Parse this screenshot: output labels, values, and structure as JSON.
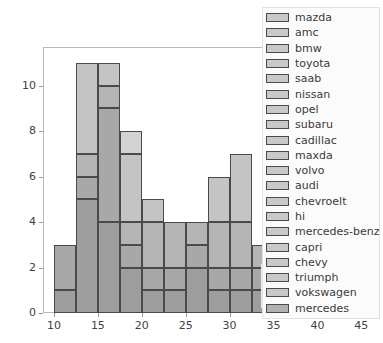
{
  "chart_data": {
    "type": "bar",
    "title": "",
    "subtitle": "",
    "xlabel": "",
    "ylabel": "Count",
    "orientation": "vertical",
    "stacked": true,
    "grid": false,
    "legend_position": "upper-right-outside",
    "xlim": [
      8.75,
      46.9
    ],
    "ylim": [
      0,
      11.7
    ],
    "xticks": [
      10,
      15,
      20,
      25,
      30,
      35,
      40,
      45
    ],
    "yticks": [
      0,
      2,
      4,
      6,
      8,
      10
    ],
    "xtick_labels": [
      "10",
      "15",
      "20",
      "25",
      "30",
      "35",
      "40",
      "45"
    ],
    "ytick_labels": [
      "0",
      "2",
      "4",
      "6",
      "8",
      "10"
    ],
    "bin_width": 2.5,
    "bars": [
      {
        "x0": 10.0,
        "x1": 12.5,
        "total": 3,
        "segments": [
          1,
          2
        ]
      },
      {
        "x0": 12.5,
        "x1": 15.0,
        "total": 11,
        "segments": [
          5,
          1,
          1,
          4
        ]
      },
      {
        "x0": 15.0,
        "x1": 17.5,
        "total": 11,
        "segments": [
          4,
          5,
          1,
          1
        ]
      },
      {
        "x0": 17.5,
        "x1": 20.0,
        "total": 8,
        "segments": [
          2,
          1,
          1,
          3,
          1
        ]
      },
      {
        "x0": 20.0,
        "x1": 22.5,
        "total": 5,
        "segments": [
          1,
          1,
          2,
          1
        ]
      },
      {
        "x0": 22.5,
        "x1": 25.0,
        "total": 4,
        "segments": [
          1,
          1,
          2
        ]
      },
      {
        "x0": 25.0,
        "x1": 27.5,
        "total": 4,
        "segments": [
          2,
          1,
          1
        ]
      },
      {
        "x0": 27.5,
        "x1": 30.0,
        "total": 6,
        "segments": [
          1,
          1,
          2,
          2
        ]
      },
      {
        "x0": 30.0,
        "x1": 32.5,
        "total": 7,
        "segments": [
          1,
          1,
          2,
          3
        ]
      },
      {
        "x0": 32.5,
        "x1": 35.0,
        "total": 3,
        "segments": [
          1,
          1,
          1
        ]
      }
    ],
    "series_colors": [
      "#9e9e9e",
      "#a8a8a8",
      "#b4b4b4",
      "#c4c4c4",
      "#d2d2d2"
    ],
    "legend_entries": [
      "mazda",
      "amc",
      "bmw",
      "toyota",
      "saab",
      "nissan",
      "opel",
      "subaru",
      "cadillac",
      "maxda",
      "volvo",
      "audi",
      "chevroelt",
      "hi",
      "mercedes-benz",
      "capri",
      "chevy",
      "triumph",
      "vokswagen",
      "mercedes"
    ]
  },
  "legend": {
    "items": [
      {
        "label": "mazda",
        "color": "#c9c9c9"
      },
      {
        "label": "amc",
        "color": "#c9c9c9"
      },
      {
        "label": "bmw",
        "color": "#c9c9c9"
      },
      {
        "label": "toyota",
        "color": "#c9c9c9"
      },
      {
        "label": "saab",
        "color": "#c9c9c9"
      },
      {
        "label": "nissan",
        "color": "#c9c9c9"
      },
      {
        "label": "opel",
        "color": "#c9c9c9"
      },
      {
        "label": "subaru",
        "color": "#c9c9c9"
      },
      {
        "label": "cadillac",
        "color": "#c9c9c9"
      },
      {
        "label": "maxda",
        "color": "#c9c9c9"
      },
      {
        "label": "volvo",
        "color": "#c9c9c9"
      },
      {
        "label": "audi",
        "color": "#c9c9c9"
      },
      {
        "label": "chevroelt",
        "color": "#c9c9c9"
      },
      {
        "label": "hi",
        "color": "#c9c9c9"
      },
      {
        "label": "mercedes-benz",
        "color": "#c9c9c9"
      },
      {
        "label": "capri",
        "color": "#c9c9c9"
      },
      {
        "label": "chevy",
        "color": "#c9c9c9"
      },
      {
        "label": "triumph",
        "color": "#c9c9c9"
      },
      {
        "label": "vokswagen",
        "color": "#c9c9c9"
      },
      {
        "label": "mercedes",
        "color": "#b0b0b0"
      }
    ]
  },
  "style": {
    "bar_edge_color": "#4a4a4a",
    "axis_color": "#b9b9bb",
    "tick_color": "#9a9a9c",
    "text_color": "#3f3f3f",
    "background": "#ffffff"
  }
}
